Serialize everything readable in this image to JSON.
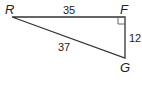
{
  "diagram": {
    "type": "right-triangle",
    "vertices": [
      {
        "name": "R",
        "x": 12,
        "y": 17
      },
      {
        "name": "F",
        "x": 125,
        "y": 17
      },
      {
        "name": "G",
        "x": 125,
        "y": 58
      }
    ],
    "right_angle_at": "F",
    "sides": [
      {
        "from": "R",
        "to": "F",
        "length": "35"
      },
      {
        "from": "F",
        "to": "G",
        "length": "12"
      },
      {
        "from": "R",
        "to": "G",
        "length": "37"
      }
    ],
    "labels": {
      "R": "R",
      "F": "F",
      "G": "G",
      "RF": "35",
      "FG": "12",
      "RG": "37"
    },
    "colors": {
      "line": "#333333",
      "text": "#222222"
    }
  }
}
